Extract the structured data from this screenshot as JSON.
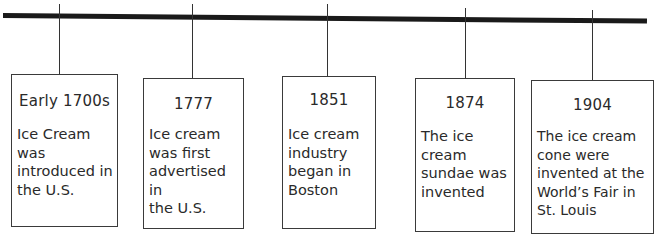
{
  "diagram": {
    "type": "timeline",
    "events": [
      {
        "year": "Early 1700s",
        "description": "Ice Cream\nwas\nintroduced in\nthe U.S."
      },
      {
        "year": "1777",
        "description": "Ice cream\nwas first\nadvertised in\nthe U.S."
      },
      {
        "year": "1851",
        "description": "Ice cream\nindustry\nbegan in\nBoston"
      },
      {
        "year": "1874",
        "description": "The ice\ncream\nsundae was\ninvented"
      },
      {
        "year": "1904",
        "description": "The ice cream\ncone were\ninvented at the\nWorld’s Fair in\nSt. Louis"
      }
    ]
  }
}
